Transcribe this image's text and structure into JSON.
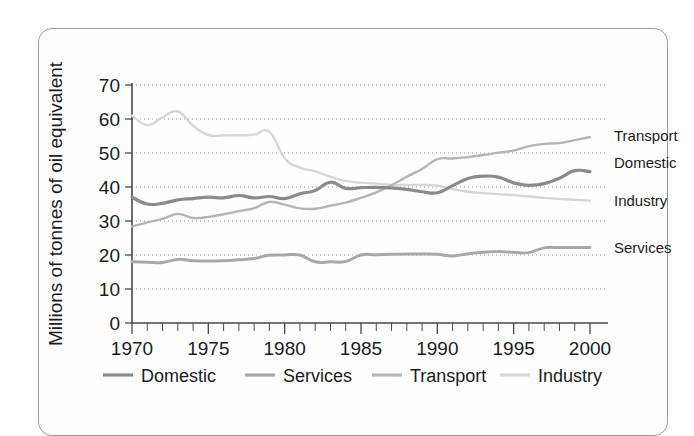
{
  "chart_data": {
    "type": "line",
    "title": "",
    "subtitle": "",
    "xlabel": "",
    "ylabel": "Millions of tonnes of oil equivalent",
    "xlim": [
      1970,
      2000
    ],
    "ylim": [
      0,
      70
    ],
    "y_ticks": [
      0,
      10,
      20,
      30,
      40,
      50,
      60,
      70
    ],
    "x_ticks": [
      1970,
      1975,
      1980,
      1985,
      1990,
      1995,
      2000
    ],
    "x_tick_labels": [
      "1970",
      "1975",
      "1980",
      "1985",
      "1990",
      "1995",
      "2000"
    ],
    "y_tick_labels": [
      "0",
      "10",
      "20",
      "30",
      "40",
      "50",
      "60",
      "70"
    ],
    "x_minor_tick_step": 1,
    "grid": "horizontal-dotted",
    "legend_position": "bottom",
    "x": [
      1970,
      1971,
      1972,
      1973,
      1974,
      1975,
      1976,
      1977,
      1978,
      1979,
      1980,
      1981,
      1982,
      1983,
      1984,
      1985,
      1986,
      1987,
      1988,
      1989,
      1990,
      1991,
      1992,
      1993,
      1994,
      1995,
      1996,
      1997,
      1998,
      1999,
      2000
    ],
    "series": [
      {
        "name": "Domestic",
        "color": "#8a8a8a",
        "width": 3.2,
        "end_label": "Domestic",
        "end_value": 47,
        "values": [
          37.0,
          35.0,
          35.2,
          36.2,
          36.6,
          37.0,
          36.8,
          37.5,
          36.8,
          37.2,
          36.6,
          38.0,
          39.0,
          41.4,
          39.6,
          39.8,
          39.9,
          39.7,
          39.3,
          38.6,
          38.3,
          40.4,
          42.5,
          43.2,
          42.9,
          41.2,
          40.5,
          41.0,
          42.6,
          44.8,
          44.5
        ]
      },
      {
        "name": "Services",
        "color": "#a8a8a8",
        "width": 3.0,
        "end_label": "Services",
        "end_value": 22,
        "values": [
          18.0,
          17.9,
          17.8,
          18.7,
          18.3,
          18.2,
          18.3,
          18.6,
          19.0,
          19.9,
          20.0,
          20.0,
          18.0,
          18.0,
          18.1,
          20.0,
          20.1,
          20.2,
          20.3,
          20.3,
          20.2,
          19.7,
          20.4,
          20.8,
          21.0,
          20.8,
          20.7,
          22.1,
          22.2,
          22.2,
          22.2
        ]
      },
      {
        "name": "Transport",
        "color": "#b4b4b4",
        "width": 2.4,
        "end_label": "Transport",
        "end_value": 55,
        "values": [
          28.4,
          29.6,
          30.6,
          32.1,
          30.9,
          31.2,
          32.0,
          32.9,
          33.8,
          35.6,
          34.8,
          33.7,
          33.6,
          34.5,
          35.4,
          36.8,
          38.4,
          40.5,
          43.0,
          45.3,
          48.2,
          48.4,
          48.8,
          49.4,
          50.1,
          50.7,
          52.0,
          52.7,
          52.9,
          53.8,
          54.7
        ]
      },
      {
        "name": "Industry",
        "color": "#d6d6d6",
        "width": 2.4,
        "end_label": "Industry",
        "end_value": 36,
        "values": [
          61.0,
          58.2,
          60.5,
          62.2,
          58.0,
          55.3,
          55.2,
          55.2,
          55.4,
          56.2,
          48.5,
          45.7,
          44.6,
          43.0,
          41.8,
          41.3,
          41.0,
          40.6,
          40.6,
          40.6,
          40.4,
          39.4,
          38.6,
          38.2,
          37.9,
          37.6,
          37.2,
          36.8,
          36.5,
          36.2,
          36.0
        ]
      }
    ]
  },
  "legend": {
    "entries": [
      {
        "label": "Domestic",
        "color": "#8a8a8a"
      },
      {
        "label": "Services",
        "color": "#a8a8a8"
      },
      {
        "label": "Transport",
        "color": "#b8b8b8"
      },
      {
        "label": "Industry",
        "color": "#d8d8d8"
      }
    ]
  },
  "axis": {
    "y_title": "Millions of tonnes of oil equivalent"
  }
}
